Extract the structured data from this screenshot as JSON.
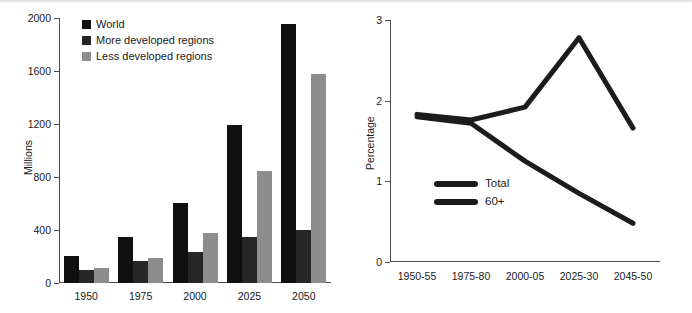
{
  "chart_data": [
    {
      "type": "bar",
      "title": "",
      "xlabel": "",
      "ylabel": "Millions",
      "categories": [
        "1950",
        "1975",
        "2000",
        "2025",
        "2050"
      ],
      "ylim": [
        0,
        2000
      ],
      "yticks": [
        0,
        400,
        800,
        1200,
        1600,
        2000
      ],
      "grid": false,
      "legend_position": "top-left",
      "series": [
        {
          "name": "World",
          "color": "#101010",
          "values": [
            205,
            350,
            605,
            1190,
            1955
          ]
        },
        {
          "name": "More developed regions",
          "color": "#262626",
          "values": [
            95,
            165,
            235,
            345,
            400
          ]
        },
        {
          "name": "Less developed regions",
          "color": "#8d8d8d",
          "values": [
            110,
            190,
            375,
            845,
            1575
          ]
        }
      ]
    },
    {
      "type": "line",
      "title": "",
      "xlabel": "",
      "ylabel": "Percentage",
      "x": [
        "1950-55",
        "1975-80",
        "2000-05",
        "2025-30",
        "2045-50"
      ],
      "ylim": [
        0,
        3
      ],
      "yticks": [
        0,
        1,
        2,
        3
      ],
      "grid": false,
      "legend_position": "inside-left",
      "series": [
        {
          "name": "Total",
          "color": "#1c1c1c",
          "values": [
            1.8,
            1.72,
            1.25,
            0.85,
            0.48
          ]
        },
        {
          "name": "60+",
          "color": "#1c1c1c",
          "values": [
            1.83,
            1.76,
            1.92,
            2.78,
            1.66
          ]
        }
      ]
    }
  ]
}
